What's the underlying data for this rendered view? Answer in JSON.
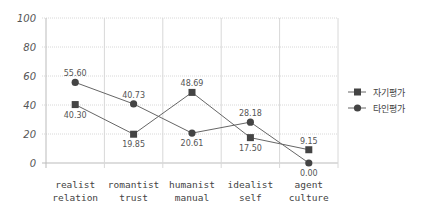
{
  "chart_data": {
    "type": "line",
    "title": "",
    "xlabel": "",
    "ylabel": "",
    "ylim": [
      0,
      100
    ],
    "yticks": [
      0,
      20,
      40,
      60,
      80,
      100
    ],
    "grid": true,
    "legend_position": "right",
    "categories": [
      [
        "realist",
        "relation"
      ],
      [
        "romantist",
        "trust"
      ],
      [
        "humanist",
        "manual"
      ],
      [
        "idealist",
        "self"
      ],
      [
        "agent",
        "culture"
      ]
    ],
    "series": [
      {
        "name": "자기평가",
        "marker": "square",
        "values": [
          40.3,
          19.85,
          48.69,
          17.5,
          9.15
        ],
        "labels": [
          "40.30",
          "19.85",
          "48.69",
          "17.50",
          "9.15"
        ],
        "label_pos": [
          "below",
          "below",
          "above",
          "below",
          "above"
        ]
      },
      {
        "name": "타인평가",
        "marker": "circle",
        "values": [
          55.6,
          40.73,
          20.61,
          28.18,
          0.0
        ],
        "labels": [
          "55.60",
          "40.73",
          "20.61",
          "28.18",
          "0.00"
        ],
        "label_pos": [
          "above",
          "above",
          "below",
          "above",
          "below"
        ]
      }
    ]
  },
  "colors": {
    "line": "#666666",
    "marker": "#444444",
    "grid": "#d8d8d8",
    "axis": "#bbbbbb"
  }
}
